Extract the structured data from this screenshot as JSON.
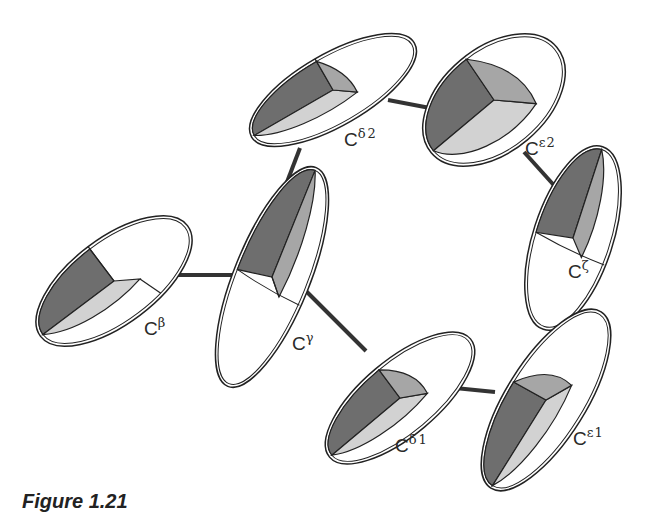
{
  "figure": {
    "caption": "Figure 1.21",
    "colors": {
      "outline": "#222222",
      "dark_octant": "#6e6e6e",
      "medium_octant": "#a6a6a6",
      "light_octant": "#d2d2d2",
      "bond": "#333333",
      "background": "#ffffff"
    }
  },
  "atoms": [
    {
      "id": "CB",
      "base": "C",
      "sup": "β",
      "sub": "",
      "label": "Cβ"
    },
    {
      "id": "CG",
      "base": "C",
      "sup": "γ",
      "sub": "",
      "label": "Cγ"
    },
    {
      "id": "CD1",
      "base": "C",
      "sup": "δ",
      "sub": "1",
      "label": "Cδ1"
    },
    {
      "id": "CD2",
      "base": "C",
      "sup": "δ",
      "sub": "2",
      "label": "Cδ2"
    },
    {
      "id": "CE1",
      "base": "C",
      "sup": "ε",
      "sub": "1",
      "label": "Cε1"
    },
    {
      "id": "CE2",
      "base": "C",
      "sup": "ε",
      "sub": "2",
      "label": "Cε2"
    },
    {
      "id": "CZ",
      "base": "C",
      "sup": "ζ",
      "sub": "",
      "label": "Cζ"
    }
  ],
  "bonds": [
    [
      "CB",
      "CG"
    ],
    [
      "CG",
      "CD1"
    ],
    [
      "CG",
      "CD2"
    ],
    [
      "CD1",
      "CE1"
    ],
    [
      "CD2",
      "CE2"
    ],
    [
      "CE1",
      "CZ"
    ],
    [
      "CE2",
      "CZ"
    ]
  ]
}
